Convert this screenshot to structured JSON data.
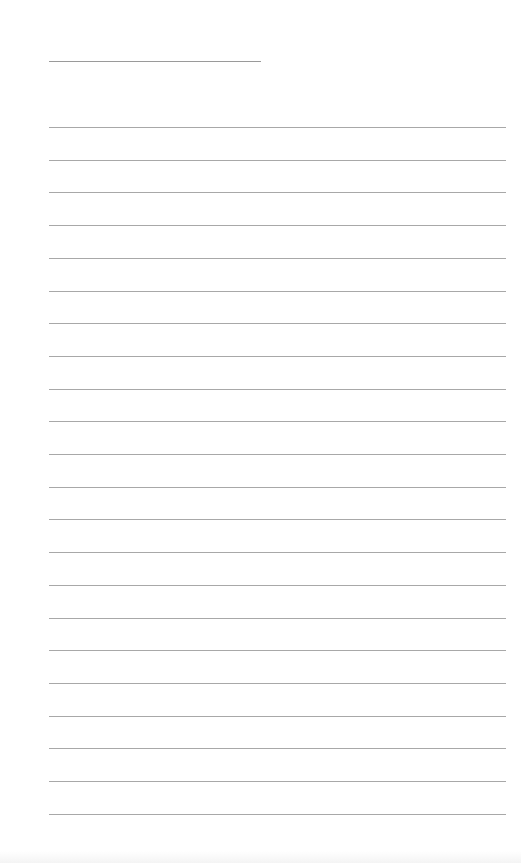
{
  "page": {
    "type": "blank lined paper",
    "name_line": {
      "present": true
    },
    "ruled_lines": {
      "count": 22,
      "first_y": 127,
      "spacing": 32.7
    },
    "line_color": "#a8a8a8",
    "background": "#ffffff"
  }
}
